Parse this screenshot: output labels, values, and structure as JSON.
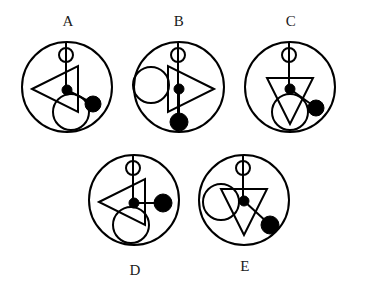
{
  "page": {
    "kind": "abstract-reasoning-figure-panel",
    "background_color": "#ffffff",
    "stroke_color": "#000000",
    "fill_color": "#000000",
    "width": 367,
    "height": 292
  },
  "figures": [
    {
      "id": "A",
      "label": "A",
      "label_position": "top",
      "outer_circle": {
        "cx": 50,
        "cy": 48,
        "r": 45
      },
      "ring": {
        "cx": 49,
        "cy": 16,
        "r": 7,
        "filled": false
      },
      "stem": {
        "x1": 49,
        "y1": 3,
        "x2": 49,
        "y2": 52
      },
      "triangle": {
        "direction": "left",
        "cx": 38,
        "cy": 50,
        "size": 23
      },
      "hub_dot": {
        "cx": 50,
        "cy": 51,
        "r": 5,
        "filled": true
      },
      "branch_line": {
        "x1": 50,
        "y1": 51,
        "x2": 75,
        "y2": 64
      },
      "branch_dot": {
        "cx": 76,
        "cy": 65,
        "r": 8,
        "filled": true
      },
      "open_circle": {
        "cx": 54,
        "cy": 73,
        "r": 18,
        "filled": false
      },
      "description": "Left-pointing triangle; branch descends to the lower right ending in a filled dot; open circle sits at lower centre."
    },
    {
      "id": "B",
      "label": "B",
      "label_position": "top",
      "outer_circle": {
        "cx": 50,
        "cy": 48,
        "r": 45
      },
      "ring": {
        "cx": 49,
        "cy": 16,
        "r": 7,
        "filled": false
      },
      "stem": {
        "x1": 49,
        "y1": 3,
        "x2": 49,
        "y2": 93
      },
      "triangle": {
        "direction": "right",
        "cx": 62,
        "cy": 50,
        "size": 23
      },
      "hub_dot": {
        "cx": 50,
        "cy": 50,
        "r": 5,
        "filled": true
      },
      "branch_line": {
        "x1": 50,
        "y1": 50,
        "x2": 50,
        "y2": 82
      },
      "branch_dot": {
        "cx": 50,
        "cy": 83,
        "r": 9,
        "filled": true
      },
      "open_circle": {
        "cx": 22,
        "cy": 46,
        "r": 18,
        "filled": false
      },
      "description": "Right-pointing triangle; branch descends straight down ending in a filled dot; open circle sits to the left."
    },
    {
      "id": "C",
      "label": "C",
      "label_position": "top",
      "outer_circle": {
        "cx": 50,
        "cy": 48,
        "r": 45
      },
      "ring": {
        "cx": 49,
        "cy": 16,
        "r": 7,
        "filled": false
      },
      "stem": {
        "x1": 49,
        "y1": 3,
        "x2": 49,
        "y2": 52
      },
      "triangle": {
        "direction": "down",
        "cx": 50,
        "cy": 62,
        "size": 23
      },
      "hub_dot": {
        "cx": 50,
        "cy": 50,
        "r": 5,
        "filled": true
      },
      "branch_line": {
        "x1": 50,
        "y1": 50,
        "x2": 75,
        "y2": 68
      },
      "branch_dot": {
        "cx": 76,
        "cy": 69,
        "r": 8,
        "filled": true
      },
      "open_circle": {
        "cx": 50,
        "cy": 73,
        "r": 18,
        "filled": false
      },
      "description": "Down-pointing triangle; branch descends to the lower right ending in a filled dot; open circle sits at lower centre."
    },
    {
      "id": "D",
      "label": "D",
      "label_position": "bottom",
      "outer_circle": {
        "cx": 50,
        "cy": 48,
        "r": 45
      },
      "ring": {
        "cx": 49,
        "cy": 16,
        "r": 7,
        "filled": false
      },
      "stem": {
        "x1": 49,
        "y1": 3,
        "x2": 49,
        "y2": 52
      },
      "triangle": {
        "direction": "left",
        "cx": 38,
        "cy": 50,
        "size": 23
      },
      "hub_dot": {
        "cx": 50,
        "cy": 51,
        "r": 5,
        "filled": true
      },
      "branch_line": {
        "x1": 50,
        "y1": 51,
        "x2": 78,
        "y2": 51
      },
      "branch_dot": {
        "cx": 79,
        "cy": 51,
        "r": 9,
        "filled": true
      },
      "open_circle": {
        "cx": 47,
        "cy": 73,
        "r": 18,
        "filled": false
      },
      "description": "Left-pointing triangle; branch runs horizontally to the right ending in a filled dot; open circle sits at lower centre."
    },
    {
      "id": "E",
      "label": "E",
      "label_position": "bottom",
      "outer_circle": {
        "cx": 50,
        "cy": 48,
        "r": 45
      },
      "ring": {
        "cx": 49,
        "cy": 16,
        "r": 7,
        "filled": false
      },
      "stem": {
        "x1": 49,
        "y1": 3,
        "x2": 49,
        "y2": 50
      },
      "triangle": {
        "direction": "down",
        "cx": 50,
        "cy": 60,
        "size": 23
      },
      "hub_dot": {
        "cx": 50,
        "cy": 49,
        "r": 5,
        "filled": true
      },
      "branch_line": {
        "x1": 50,
        "y1": 49,
        "x2": 75,
        "y2": 72
      },
      "branch_dot": {
        "cx": 76,
        "cy": 73,
        "r": 9,
        "filled": true
      },
      "open_circle": {
        "cx": 27,
        "cy": 50,
        "r": 18,
        "filled": false
      },
      "description": "Down-pointing triangle; branch descends to the lower right ending in a filled dot; open circle sits to the upper left."
    }
  ]
}
